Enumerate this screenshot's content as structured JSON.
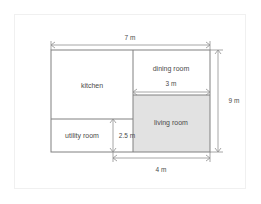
{
  "diagram": {
    "rooms": [
      {
        "id": "kitchen",
        "label": "kitchen",
        "shaded": false
      },
      {
        "id": "dining-room",
        "label": "dining room",
        "shaded": false
      },
      {
        "id": "living-room",
        "label": "living room",
        "shaded": true
      },
      {
        "id": "utility-room",
        "label": "utility room",
        "shaded": false
      }
    ],
    "dimensions": [
      {
        "id": "overall-width",
        "label": "7 m",
        "orientation": "horizontal"
      },
      {
        "id": "overall-height",
        "label": "9 m",
        "orientation": "vertical"
      },
      {
        "id": "living-width",
        "label": "3 m",
        "orientation": "horizontal"
      },
      {
        "id": "utility-height",
        "label": "2.5 m",
        "orientation": "vertical"
      },
      {
        "id": "bottom-width",
        "label": "4 m",
        "orientation": "horizontal"
      }
    ],
    "colors": {
      "wall": "#808080",
      "dimension": "#909090",
      "shaded_fill": "#e2e2e2",
      "plain_fill": "#ffffff",
      "text": "#4a4a4a",
      "frame": "#f0f0f0",
      "background": "#ffffff"
    }
  }
}
